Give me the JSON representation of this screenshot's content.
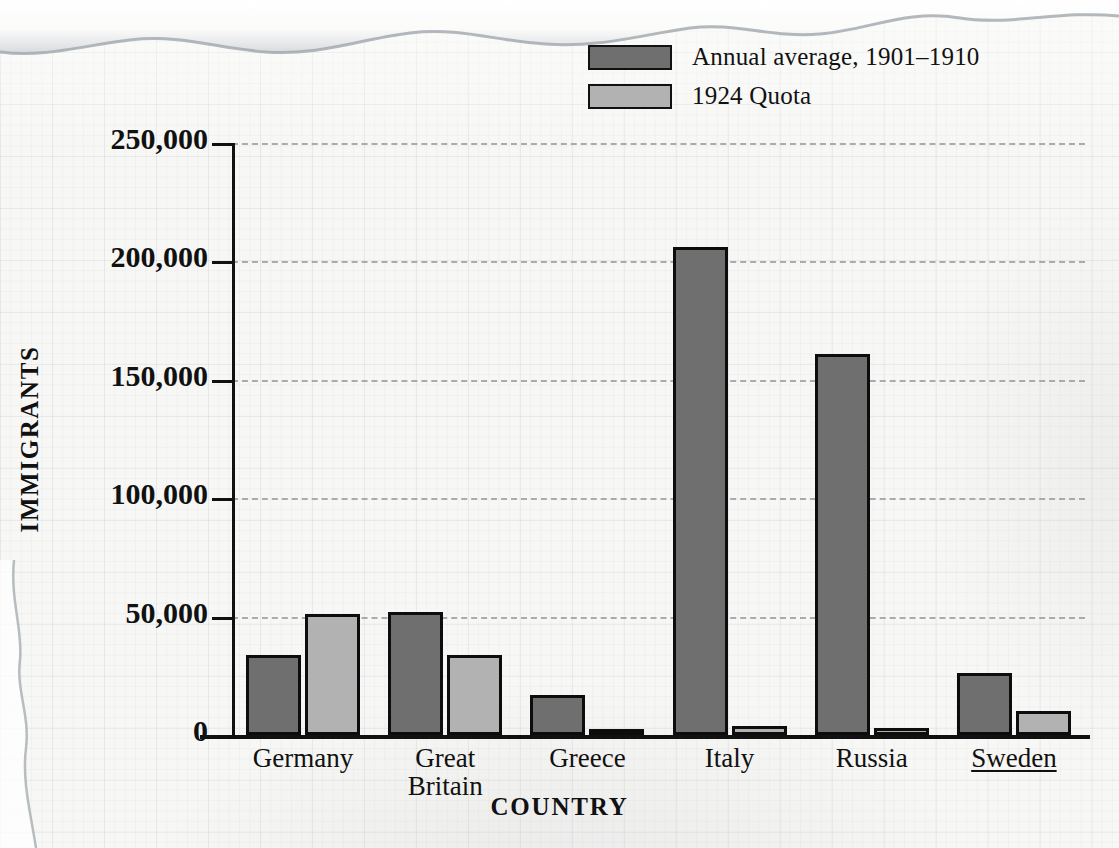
{
  "chart_data": {
    "type": "bar",
    "title": "",
    "xlabel": "COUNTRY",
    "ylabel": "IMMIGRANTS",
    "categories": [
      "Germany",
      "Great Britain",
      "Greece",
      "Italy",
      "Russia",
      "Sweden"
    ],
    "series": [
      {
        "name": "Annual average, 1901–1910",
        "color": "#6f6f6f",
        "values": [
          34000,
          52000,
          17000,
          206000,
          161000,
          26000
        ]
      },
      {
        "name": "1924 Quota",
        "color": "#b2b2b2",
        "values": [
          51000,
          34000,
          2000,
          4000,
          3000,
          10000
        ]
      }
    ],
    "ylim": [
      0,
      250000
    ],
    "yticks": [
      0,
      50000,
      100000,
      150000,
      200000,
      250000
    ],
    "ytick_labels": [
      "0",
      "50,000",
      "100,000",
      "150,000",
      "200,000",
      "250,000"
    ],
    "grid": "horizontal-dashed",
    "legend_position": "top-center"
  },
  "axes": {
    "y_title": "IMMIGRANTS",
    "x_title": "COUNTRY"
  },
  "legend": {
    "items": [
      {
        "label": "Annual average, 1901–1910",
        "color": "#6f6f6f"
      },
      {
        "label": "1924 Quota",
        "color": "#b2b2b2"
      }
    ]
  },
  "xlabels": [
    {
      "line1": "Germany",
      "line2": "",
      "underline": false
    },
    {
      "line1": "Great",
      "line2": "Britain",
      "underline": false
    },
    {
      "line1": "Greece",
      "line2": "",
      "underline": false
    },
    {
      "line1": "Italy",
      "line2": "",
      "underline": false
    },
    {
      "line1": "Russia",
      "line2": "",
      "underline": false
    },
    {
      "line1": "Sweden",
      "line2": "",
      "underline": true
    }
  ],
  "colors": {
    "dark_bar": "#6f6f6f",
    "light_bar": "#b2b2b2",
    "ink": "#111111",
    "gridline": "#9aa0a6",
    "paper": "#f7f7f5"
  }
}
